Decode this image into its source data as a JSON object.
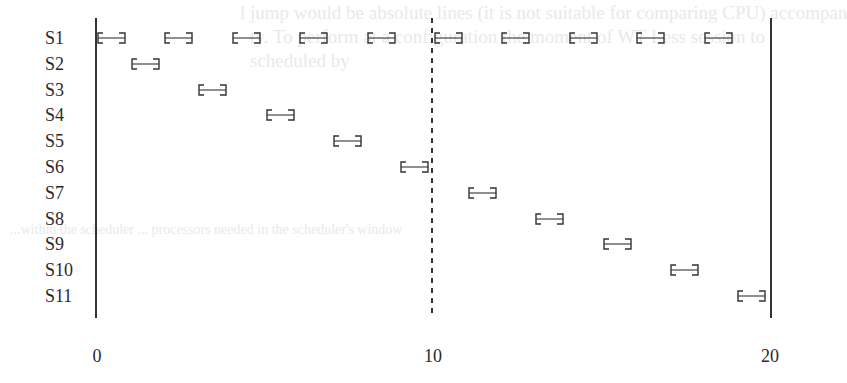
{
  "chart_data": {
    "type": "gantt",
    "title": "",
    "x_axis": {
      "min": 0,
      "max": 20,
      "ticks": [
        "0",
        "10",
        "20"
      ],
      "reference_lines": [
        {
          "x": 0,
          "style": "solid"
        },
        {
          "x": 10,
          "style": "dashed"
        },
        {
          "x": 20,
          "style": "solid"
        }
      ]
    },
    "bar_width": 0.85,
    "rows": [
      {
        "label": "S1",
        "starts": [
          0,
          2,
          4,
          6,
          8,
          10,
          12,
          14,
          16,
          18
        ]
      },
      {
        "label": "S2",
        "starts": [
          1
        ]
      },
      {
        "label": "S3",
        "starts": [
          3
        ]
      },
      {
        "label": "S4",
        "starts": [
          5
        ]
      },
      {
        "label": "S5",
        "starts": [
          7
        ]
      },
      {
        "label": "S6",
        "starts": [
          9
        ]
      },
      {
        "label": "S7",
        "starts": [
          11
        ]
      },
      {
        "label": "S8",
        "starts": [
          13
        ]
      },
      {
        "label": "S9",
        "starts": [
          15
        ]
      },
      {
        "label": "S10",
        "starts": [
          17
        ]
      },
      {
        "label": "S11",
        "starts": [
          19
        ]
      }
    ]
  },
  "labels": {
    "rows": [
      "S1",
      "S2",
      "S3",
      "S4",
      "S5",
      "S6",
      "S7",
      "S8",
      "S9",
      "S10",
      "S11"
    ],
    "ticks": [
      "0",
      "10",
      "20"
    ]
  },
  "ghost_text": [
    "l jump would be absolute lines (it is not suitable for comparing CPU) accompan",
    "ty. To perform at a configuration the moment of WT Less session to",
    "scheduled by",
    "...within the scheduler ... processors needed in the scheduler's window"
  ]
}
